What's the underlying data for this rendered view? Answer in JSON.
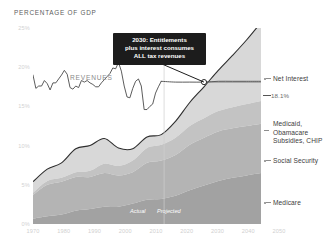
{
  "chart_data": {
    "type": "area",
    "title": "PERCENTAGE OF GDP",
    "xlabel": "",
    "ylabel": "Percentage of GDP",
    "xlim": [
      1970,
      2050
    ],
    "ylim": [
      0,
      25
    ],
    "grid": false,
    "legend_position": "right",
    "stacked": true,
    "x": [
      1970,
      1975,
      1980,
      1985,
      1990,
      1995,
      2000,
      2005,
      2010,
      2015,
      2020,
      2025,
      2030,
      2035,
      2040,
      2045,
      2050
    ],
    "series": [
      {
        "name": "Medicare",
        "color": "#a2a2a2",
        "values": [
          0.7,
          1.0,
          1.2,
          1.7,
          1.9,
          2.2,
          2.2,
          2.6,
          3.1,
          3.2,
          3.6,
          4.3,
          4.9,
          5.5,
          5.9,
          6.2,
          6.5
        ]
      },
      {
        "name": "Social Security",
        "color": "#b4b4b4",
        "values": [
          3.0,
          4.0,
          4.2,
          4.3,
          4.1,
          4.3,
          4.0,
          4.0,
          4.7,
          4.9,
          5.2,
          5.8,
          6.1,
          6.3,
          6.3,
          6.3,
          6.3
        ]
      },
      {
        "name": "Medicaid, Obamacare Subsidies, CHIP",
        "color": "#c3c3c3",
        "values": [
          0.3,
          0.5,
          0.5,
          0.6,
          0.8,
          1.2,
          1.2,
          1.5,
          1.9,
          2.0,
          2.2,
          2.4,
          2.5,
          2.6,
          2.7,
          2.8,
          2.9
        ]
      },
      {
        "name": "Net Interest",
        "color": "#d8d8d8",
        "values": [
          1.4,
          1.5,
          1.9,
          3.0,
          3.2,
          3.2,
          2.3,
          1.5,
          1.4,
          1.3,
          2.1,
          3.0,
          4.0,
          5.2,
          6.6,
          8.2,
          10.0
        ]
      }
    ],
    "overlay_line": {
      "name": "REVENUES",
      "color": "#4a4a4a",
      "label_value": "18.1%",
      "x": [
        1970,
        1971,
        1972,
        1973,
        1974,
        1975,
        1976,
        1977,
        1978,
        1979,
        1980,
        1981,
        1982,
        1983,
        1984,
        1985,
        1986,
        1987,
        1988,
        1989,
        1990,
        1991,
        1992,
        1993,
        1994,
        1995,
        1996,
        1997,
        1998,
        1999,
        2000,
        2001,
        2002,
        2003,
        2004,
        2005,
        2006,
        2007,
        2008,
        2009,
        2010,
        2011,
        2012,
        2013,
        2014,
        2015,
        2020,
        2025,
        2030,
        2035,
        2040,
        2045,
        2050
      ],
      "values": [
        19.0,
        17.3,
        17.6,
        17.6,
        18.3,
        17.9,
        17.1,
        18.0,
        18.0,
        18.5,
        19.0,
        19.6,
        19.1,
        17.4,
        17.2,
        17.6,
        17.4,
        18.3,
        18.1,
        18.3,
        18.0,
        17.8,
        17.5,
        17.5,
        18.0,
        18.4,
        18.8,
        19.2,
        19.9,
        19.8,
        20.6,
        19.5,
        17.6,
        16.2,
        16.1,
        17.3,
        18.2,
        18.5,
        17.6,
        14.6,
        14.6,
        15.0,
        15.3,
        16.7,
        17.5,
        18.2,
        18.1,
        18.1,
        18.1,
        18.2,
        18.2,
        18.2,
        18.2
      ]
    },
    "y_ticks": [
      "25%",
      "20%",
      "15%",
      "10%",
      "5%",
      "0%"
    ],
    "y_tick_values": [
      25,
      20,
      15,
      10,
      5,
      0
    ],
    "x_ticks": [
      "1970",
      "1980",
      "1990",
      "2000",
      "2010",
      "2020",
      "2030",
      "2040",
      "2050"
    ],
    "x_tick_values": [
      1970,
      1980,
      1990,
      2000,
      2010,
      2020,
      2030,
      2040,
      2050
    ],
    "annotations": [
      {
        "name": "crossover-callout",
        "text": "2030: Entitlements plus interest consumes ALL tax revenues",
        "point_x": 2030,
        "point_y": 18.1
      }
    ],
    "divider": {
      "x": 2016,
      "left_label": "Actual",
      "right_label": "Projected"
    }
  },
  "chart": {
    "axis_title": "PERCENTAGE OF GDP",
    "revenues_label": "REVENUES",
    "callout_line1": "2030: Entitlements",
    "callout_line2": "plus interest consumes",
    "callout_line3": "ALL tax revenues",
    "actual_label": "Actual",
    "projected_label": "Projected",
    "value_marker": "18.1%"
  },
  "legend": {
    "net_interest": "Net Interest",
    "medicaid": "Medicaid,\nObamacare\nSubsidies, CHIP",
    "social_security": "Social Security",
    "medicare": "Medicare"
  },
  "y_axis": {
    "t0": "25%",
    "t1": "20%",
    "t2": "15%",
    "t3": "10%",
    "t4": "5%",
    "t5": "0%"
  },
  "x_axis": {
    "t0": "1970",
    "t1": "1980",
    "t2": "1990",
    "t3": "2000",
    "t4": "2010",
    "t5": "2020",
    "t6": "2030",
    "t7": "2040",
    "t8": "2050"
  },
  "colors": {
    "net_interest": "#d8d8d8",
    "medicaid": "#c3c3c3",
    "social_security": "#b4b4b4",
    "medicare": "#a2a2a2",
    "revenue_line": "#4a4a4a",
    "callout_bg": "#1c1c1c"
  }
}
